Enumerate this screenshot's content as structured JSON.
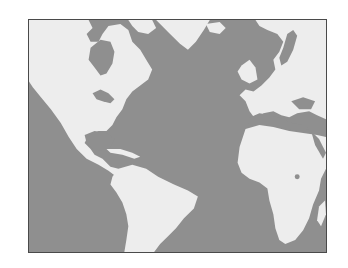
{
  "map": {
    "title": "Atlantic Ocean region world map",
    "colors": {
      "ocean": "#8f8f8f",
      "land": "#ededed",
      "frame": "#4a4a4a",
      "background": "#ffffff"
    },
    "regions": [
      {
        "name": "North America"
      },
      {
        "name": "Greenland"
      },
      {
        "name": "Central America & Caribbean"
      },
      {
        "name": "South America"
      },
      {
        "name": "Europe"
      },
      {
        "name": "Africa"
      },
      {
        "name": "Atlantic Ocean"
      }
    ]
  }
}
